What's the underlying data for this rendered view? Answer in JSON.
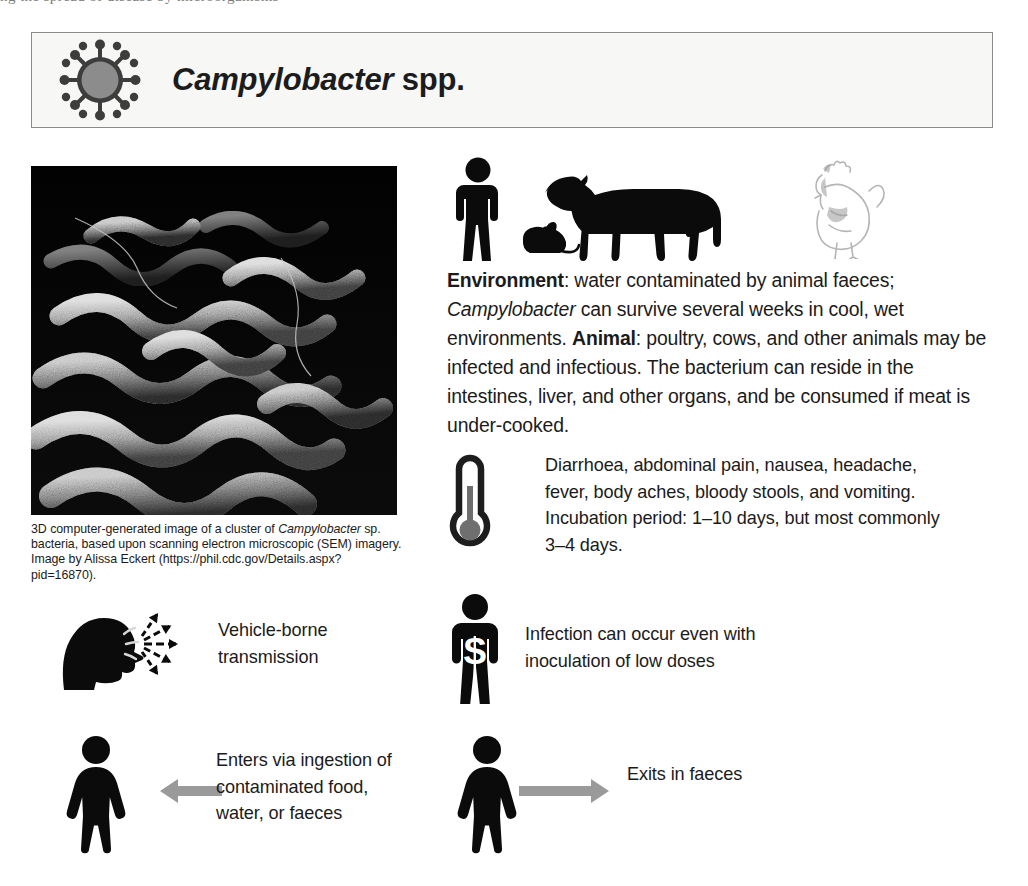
{
  "page": {
    "background_color": "#ffffff",
    "text_color": "#1b1b1b"
  },
  "top_sliver": {
    "clipped_text": "ng the spread of disease by microorganisms"
  },
  "header": {
    "icon_name": "virus-particle-icon",
    "title_italic": "Campylobacter",
    "title_plain": " spp.",
    "border_color": "#8a8a8a",
    "background_color": "#f7f7f5",
    "icon_core_color": "#8c8c8c",
    "icon_outline_color": "#3d3d3d"
  },
  "figure": {
    "image_name": "campylobacter-sem-image",
    "caption_part1": "3D computer-generated image of a cluster of ",
    "caption_italic": "Campylobacter",
    "caption_part2": " sp. bacteria, based upon scanning electron microscopic (SEM) imagery. Image by Alissa Eckert (https://phil.cdc.gov/Details.aspx?pid=16870)."
  },
  "reservoir": {
    "icons": [
      {
        "name": "person-cow-mouse-silhouette-icon",
        "color": "#0b0b0b"
      },
      {
        "name": "chicken-line-drawing-icon",
        "color": "#b8b8b8"
      }
    ],
    "label_environment": "Environment",
    "text_environment_1": ": water contaminated by animal faeces; ",
    "text_pathogen_italic": "Campylobacter",
    "text_environment_2": " can survive several weeks in cool, wet environments. ",
    "label_animal": "Animal",
    "text_animal": ": poultry, cows, and other animals may be infected and infectious. The bacterium can reside in the intestines, liver, and other organs, and be consumed if meat is under-cooked."
  },
  "symptoms": {
    "icon_name": "thermometer-icon",
    "text": "Diarrhoea, abdominal pain, nausea, headache, fever, body aches, bloody stools, and vomiting. Incubation period: 1–10 days, but most commonly 3–4 days."
  },
  "transmission": {
    "icon_name": "coughing-head-with-dashed-arrows-icon",
    "text_line1": "Vehicle-borne",
    "text_line2": "transmission"
  },
  "dose": {
    "icon_name": "person-with-s-torso-icon",
    "text_line1": "Infection can occur even with",
    "text_line2": "inoculation of low doses"
  },
  "entry": {
    "icon_name": "female-figure-icon",
    "arrow_name": "arrow-left-icon",
    "arrow_color": "#9a9a9a",
    "text_line1": "Enters via ingestion of",
    "text_line2": "contaminated food,",
    "text_line3": "water, or faeces"
  },
  "exit": {
    "icon_name": "female-figure-icon",
    "arrow_name": "arrow-right-icon",
    "arrow_color": "#9a9a9a",
    "text": "Exits in faeces"
  }
}
